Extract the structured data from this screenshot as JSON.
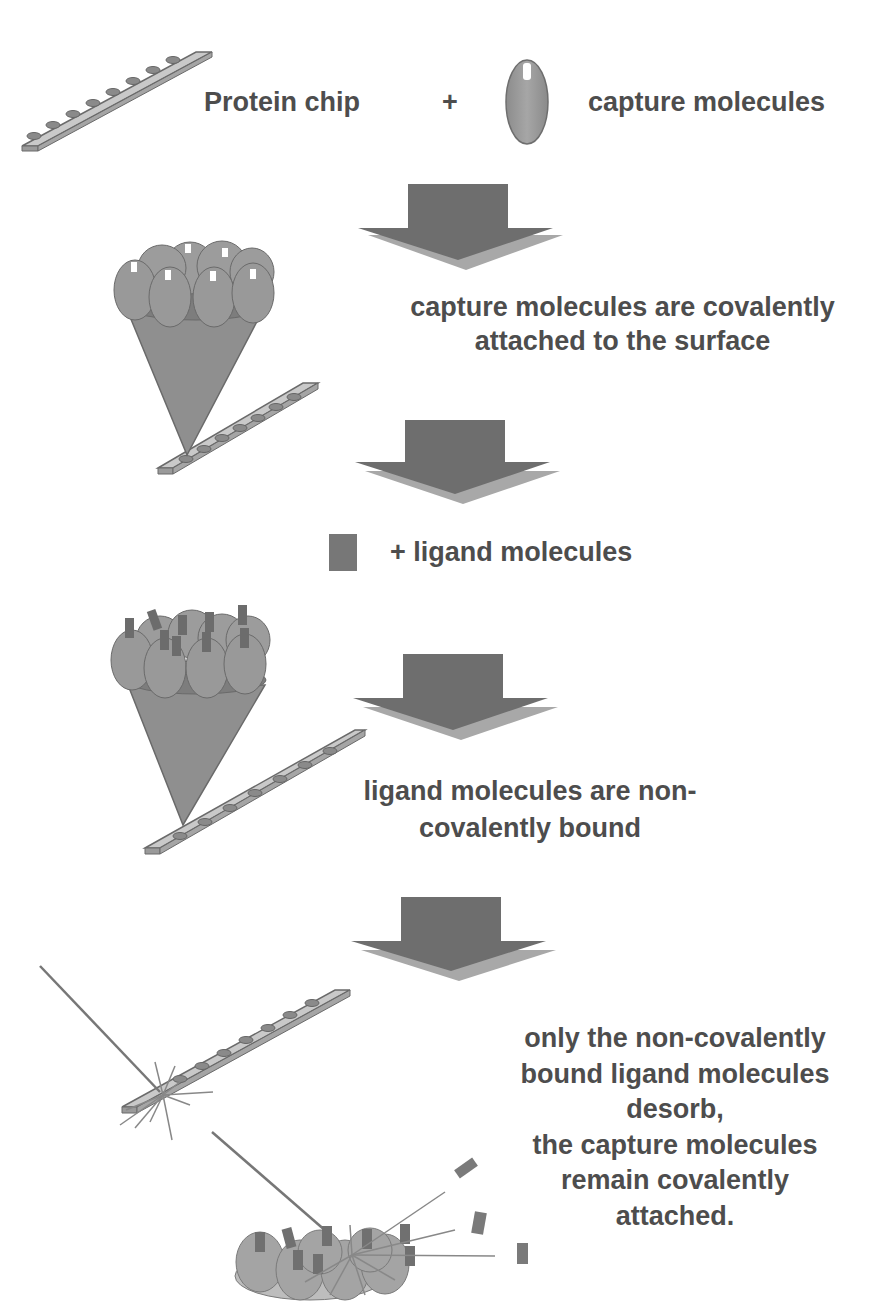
{
  "diagram": {
    "title_cut_off": "· · · ·",
    "step1": {
      "chip_label": "Protein chip",
      "plus": "+",
      "molecule_label": "capture molecules"
    },
    "step2": {
      "line1": "capture molecules are covalently",
      "line2": "attached to the surface"
    },
    "step3": {
      "ligand_label": "+ ligand molecules"
    },
    "step4": {
      "line1": "ligand molecules are non-",
      "line2": "covalently bound"
    },
    "step5": {
      "line1": "only the non-covalently",
      "line2": "bound ligand molecules",
      "line3": "desorb,",
      "line4": "the capture molecules",
      "line5": "remain covalently",
      "line6": "attached."
    },
    "colors": {
      "arrow_dark": "#6e6e6e",
      "arrow_light": "#a8a8a8",
      "molecule_fill": "#9a9a9a",
      "chip_fill": "#c8c8c8",
      "ligand_fill": "#707070",
      "text": "#4d4d4d"
    }
  }
}
